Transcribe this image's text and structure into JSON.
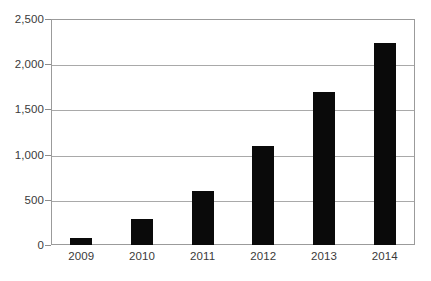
{
  "chart_data": {
    "type": "bar",
    "title": "",
    "subtitle": "",
    "xlabel": "",
    "ylabel": "",
    "categories": [
      "2009",
      "2010",
      "2011",
      "2012",
      "2013",
      "2014"
    ],
    "values": [
      75,
      285,
      595,
      1090,
      1690,
      2230
    ],
    "series": [
      {
        "name": "",
        "values": [
          75,
          285,
          595,
          1090,
          1690,
          2230
        ]
      }
    ],
    "ylim": [
      0,
      2500
    ],
    "y_ticks": [
      0,
      500,
      1000,
      1500,
      2000,
      2500
    ],
    "y_tick_labels": [
      "0",
      "500",
      "1,000",
      "1,500",
      "2,000",
      "2,500"
    ],
    "grid": true,
    "legend": false,
    "legend_position": "none",
    "bar_color": "#0a0a0a",
    "gridline_color": "#a9a9a9",
    "axis_color": "#9b9b9b",
    "background_color": "#ffffff",
    "text_color": "#3a3a3a"
  }
}
